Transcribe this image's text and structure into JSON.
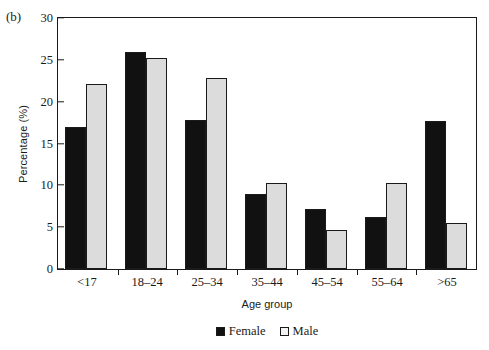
{
  "panel": {
    "label": "(b)"
  },
  "chart_data": {
    "type": "bar",
    "title": "",
    "subtitle": "",
    "xlabel": "Age group",
    "ylabel": "Percentage (%)",
    "categories": [
      "<17",
      "18–24",
      "25–34",
      "35–44",
      "45–54",
      "55–64",
      ">65"
    ],
    "series": [
      {
        "name": "Female",
        "color": "#111111",
        "values": [
          16.8,
          25.7,
          17.7,
          8.9,
          7.1,
          6.2,
          17.6
        ]
      },
      {
        "name": "Male",
        "color": "#dcdcdc",
        "values": [
          21.9,
          25.0,
          22.6,
          10.2,
          4.6,
          10.2,
          5.4
        ]
      }
    ],
    "ylim": [
      0,
      30
    ],
    "yticks": [
      0,
      5,
      10,
      15,
      20,
      25,
      30
    ],
    "ytick_labels": [
      "0",
      "5",
      "10",
      "15",
      "20",
      "25",
      "30"
    ],
    "grid": false,
    "legend_position": "bottom-center",
    "legend_entries": [
      "Female",
      "Male"
    ]
  }
}
